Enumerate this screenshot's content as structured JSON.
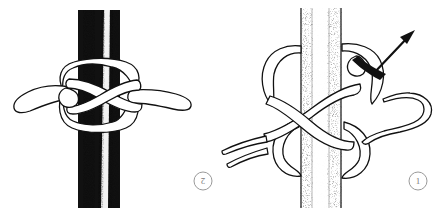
{
  "figure": {
    "background_color": "#ffffff",
    "width": 444,
    "height": 208,
    "ink_color": "#111111",
    "step_label_color": "#7a7a7a"
  },
  "panels": [
    {
      "id": "panel-left",
      "step_number": "2",
      "step_number_position": {
        "x": 203,
        "y": 184
      },
      "caption": "",
      "pole": {
        "name": "pole-dark",
        "fill": "#111111",
        "highlight_color": "#ffffff",
        "x": 78,
        "width": 42,
        "top": 10,
        "bottom": 208
      },
      "rope": {
        "name": "rope-knot-tightened",
        "fill": "#ffffff",
        "stroke": "#111111",
        "state": "tightened"
      },
      "tails": [
        {
          "name": "rope-tail-left",
          "direction": "left"
        },
        {
          "name": "rope-tail-right",
          "direction": "right"
        }
      ]
    },
    {
      "id": "panel-right",
      "step_number": "1",
      "step_number_position": {
        "x": 418,
        "y": 184
      },
      "caption": "",
      "pole": {
        "name": "pole-light",
        "fill": "#fdfdfd",
        "highlight_color": "#ffffff",
        "x": 300,
        "width": 42,
        "top": 8,
        "bottom": 208
      },
      "rope": {
        "name": "rope-knot-loose",
        "fill": "#ffffff",
        "stroke": "#111111",
        "state": "loose"
      },
      "tails": [
        {
          "name": "rope-tail-left-upper",
          "direction": "left"
        },
        {
          "name": "rope-tail-left-lower",
          "direction": "left"
        },
        {
          "name": "rope-tail-right-hook",
          "direction": "right"
        }
      ],
      "arrow": {
        "name": "pull-direction-arrow",
        "from": {
          "x": 385,
          "y": 75
        },
        "to": {
          "x": 415,
          "y": 33
        },
        "color": "#111111",
        "meaning": "pull direction"
      }
    }
  ]
}
